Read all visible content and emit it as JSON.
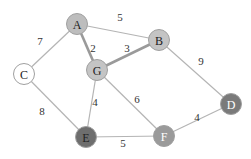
{
  "graph": {
    "nodes": [
      {
        "id": "A",
        "label": "A",
        "x": 77,
        "y": 24,
        "fill": "#bdbdbd",
        "text": "#222222"
      },
      {
        "id": "B",
        "label": "B",
        "x": 159,
        "y": 40,
        "fill": "#c4c4c4",
        "text": "#222222"
      },
      {
        "id": "C",
        "label": "C",
        "x": 24,
        "y": 74,
        "fill": "#ffffff",
        "text": "#222222"
      },
      {
        "id": "G",
        "label": "G",
        "x": 97,
        "y": 70,
        "fill": "#c4c4c4",
        "text": "#222222"
      },
      {
        "id": "E",
        "label": "E",
        "x": 86,
        "y": 137,
        "fill": "#6e6e6e",
        "text": "#222222"
      },
      {
        "id": "F",
        "label": "F",
        "x": 164,
        "y": 136,
        "fill": "#9a9a9a",
        "text": "#ffffff"
      },
      {
        "id": "D",
        "label": "D",
        "x": 231,
        "y": 104,
        "fill": "#7a7a7a",
        "text": "#ffffff"
      }
    ],
    "edges": [
      {
        "from": "A",
        "to": "B",
        "weight": "5",
        "lx": 120,
        "ly": 17,
        "heavy": false
      },
      {
        "from": "A",
        "to": "C",
        "weight": "7",
        "lx": 40,
        "ly": 41,
        "heavy": false
      },
      {
        "from": "A",
        "to": "G",
        "weight": "2",
        "lx": 93,
        "ly": 48,
        "heavy": true
      },
      {
        "from": "G",
        "to": "B",
        "weight": "3",
        "lx": 127,
        "ly": 48,
        "heavy": true
      },
      {
        "from": "B",
        "to": "D",
        "weight": "9",
        "lx": 201,
        "ly": 61,
        "heavy": false
      },
      {
        "from": "C",
        "to": "E",
        "weight": "8",
        "lx": 42,
        "ly": 111,
        "heavy": false
      },
      {
        "from": "G",
        "to": "E",
        "weight": "4",
        "lx": 95,
        "ly": 102,
        "heavy": false
      },
      {
        "from": "G",
        "to": "F",
        "weight": "6",
        "lx": 137,
        "ly": 99,
        "heavy": false
      },
      {
        "from": "E",
        "to": "F",
        "weight": "5",
        "lx": 123,
        "ly": 143,
        "heavy": false
      },
      {
        "from": "F",
        "to": "D",
        "weight": "4",
        "lx": 197,
        "ly": 117,
        "heavy": false
      }
    ]
  }
}
